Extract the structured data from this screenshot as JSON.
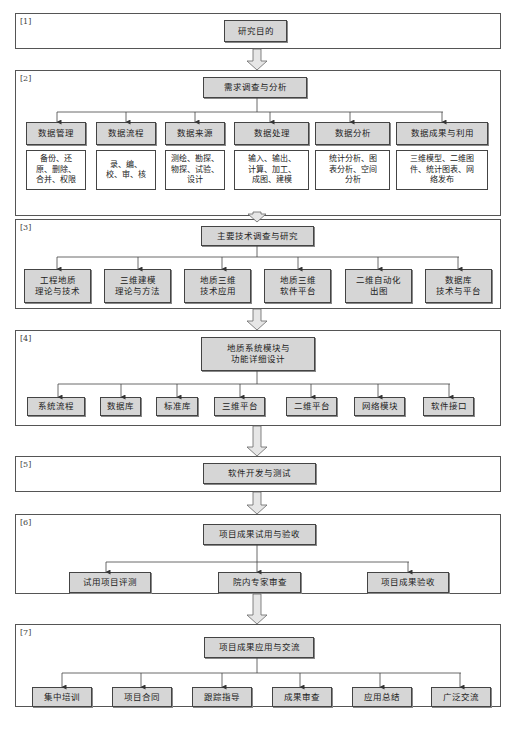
{
  "sections": [
    {
      "label": "[1]",
      "title": "研究目的",
      "children": []
    },
    {
      "label": "[2]",
      "title": "需求调查与分析",
      "children": [
        "数据管理",
        "数据流程",
        "数据来源",
        "数据处理",
        "数据分析",
        "数据成果与利用"
      ],
      "details": [
        "备份、还\n原、删除、\n合并、权限",
        "录、编、\n校、审、核",
        "测绘、勘探、\n物探、试验、\n设计",
        "输入、输出、\n计算、加工、\n成图、建模",
        "统计分析、图\n表分析、空间\n分析",
        "三维模型、二维图\n件、统计图表、网\n络发布"
      ]
    },
    {
      "label": "[3]",
      "title": "主要技术调查与研究",
      "children": [
        "工程地质\n理论与技术",
        "三维建模\n理论与方法",
        "地质三维\n技术应用",
        "地质三维\n软件平台",
        "二维自动化\n出图",
        "数据库\n技术与平台"
      ]
    },
    {
      "label": "[4]",
      "title": "地质系统模块与\n功能详细设计",
      "children": [
        "系统流程",
        "数据库",
        "标准库",
        "三维平台",
        "二维平台",
        "网络模块",
        "软件接口"
      ]
    },
    {
      "label": "[5]",
      "title": "软件开发与测试",
      "children": []
    },
    {
      "label": "[6]",
      "title": "项目成果试用与验收",
      "children": [
        "试用项目评测",
        "院内专家审查",
        "项目成果验收"
      ]
    },
    {
      "label": "[7]",
      "title": "项目成果应用与交流",
      "children": [
        "集中培训",
        "项目合同",
        "跟踪指导",
        "成果审查",
        "应用总结",
        "广泛交流"
      ]
    }
  ]
}
